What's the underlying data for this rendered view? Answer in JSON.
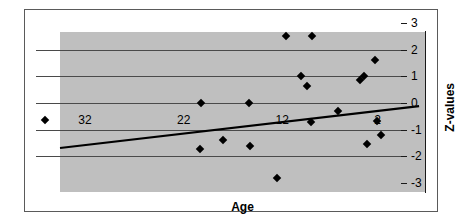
{
  "chart_data": {
    "type": "scatter",
    "title": "",
    "xlabel": "Age",
    "ylabel": "Z-values",
    "xlim": [
      37,
      0
    ],
    "ylim": [
      -3,
      3
    ],
    "x_reversed": true,
    "grid": true,
    "legend": "none",
    "background_color": "#bfbfbf",
    "marker_color": "#000000",
    "marker_shape": "diamond",
    "trendline_color": "#000000",
    "x_tick_labels": [
      "32",
      "22",
      "12",
      "2"
    ],
    "x_tick_values": [
      32,
      22,
      12,
      2
    ],
    "y_tick_labels": [
      "3",
      "2",
      "1",
      "0",
      "-1",
      "-2",
      "-3"
    ],
    "y_tick_values": [
      3,
      2,
      1,
      0,
      -1,
      -2,
      -3
    ],
    "points": [
      {
        "x": 36.1,
        "y": -0.65
      },
      {
        "x": 20.3,
        "y": 0.0
      },
      {
        "x": 20.4,
        "y": -1.72
      },
      {
        "x": 18.0,
        "y": -1.38
      },
      {
        "x": 15.4,
        "y": 0.0
      },
      {
        "x": 15.3,
        "y": -1.6
      },
      {
        "x": 12.6,
        "y": -2.8
      },
      {
        "x": 11.7,
        "y": 2.5
      },
      {
        "x": 10.1,
        "y": 1.02
      },
      {
        "x": 9.5,
        "y": 0.62
      },
      {
        "x": 9.1,
        "y": -0.72
      },
      {
        "x": 9.0,
        "y": 2.5
      },
      {
        "x": 6.4,
        "y": -0.3
      },
      {
        "x": 4.2,
        "y": 0.85
      },
      {
        "x": 3.8,
        "y": 1.02
      },
      {
        "x": 3.4,
        "y": -1.55
      },
      {
        "x": 2.6,
        "y": 1.62
      },
      {
        "x": 2.4,
        "y": -0.68
      },
      {
        "x": 2.0,
        "y": -1.2
      }
    ],
    "trendline": {
      "x_start": 37.0,
      "y_start": -1.35,
      "x_end": 0.6,
      "y_end": 0.22
    }
  },
  "axis_titles": {
    "x": "Age",
    "y": "Z-values"
  }
}
